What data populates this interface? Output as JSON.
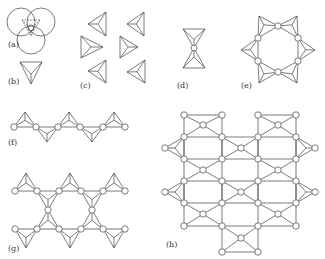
{
  "figure": {
    "panels": [
      {
        "id": "a",
        "label": "(a)",
        "label_pos": [
          8,
          46
        ]
      },
      {
        "id": "b",
        "label": "(b)",
        "label_pos": [
          8,
          82
        ]
      },
      {
        "id": "c",
        "label": "(c)",
        "label_pos": [
          81,
          86
        ]
      },
      {
        "id": "d",
        "label": "(d)",
        "label_pos": [
          177,
          86
        ]
      },
      {
        "id": "e",
        "label": "(e)",
        "label_pos": [
          241,
          86
        ]
      },
      {
        "id": "f",
        "label": "(f)",
        "label_pos": [
          8,
          143
        ]
      },
      {
        "id": "g",
        "label": "(g)",
        "label_pos": [
          8,
          249
        ]
      },
      {
        "id": "h",
        "label": "(h)",
        "label_pos": [
          166,
          245
        ]
      }
    ]
  },
  "colors": {
    "stroke": "#444444",
    "node_fill": "#ffffff",
    "label": "#333333"
  },
  "geometry": {
    "a": {
      "big_circles": [
        [
          21,
          22,
          14
        ],
        [
          41,
          22,
          14
        ],
        [
          31,
          39,
          14
        ]
      ],
      "center_circle": [
        31,
        28,
        3
      ],
      "dashed_lines": [
        [
          31,
          17,
          31,
          25
        ],
        [
          22,
          33,
          28,
          30
        ],
        [
          40,
          33,
          34,
          30
        ],
        [
          24,
          19,
          29,
          26
        ],
        [
          38,
          19,
          33,
          26
        ],
        [
          31,
          31,
          31,
          36
        ]
      ]
    },
    "tetrahedra_c": [
      {
        "tip": [
          88,
          24
        ],
        "base": [
          [
            106,
            12
          ],
          [
            106,
            36
          ]
        ],
        "dir": "left"
      },
      {
        "tip": [
          103,
          47
        ],
        "base": [
          [
            81,
            36
          ],
          [
            81,
            58
          ]
        ],
        "dir": "right"
      },
      {
        "tip": [
          88,
          71
        ],
        "base": [
          [
            106,
            60
          ],
          [
            106,
            83
          ]
        ],
        "dir": "left"
      },
      {
        "tip": [
          127,
          24
        ],
        "base": [
          [
            144,
            12
          ],
          [
            144,
            36
          ]
        ],
        "dir": "left"
      },
      {
        "tip": [
          138,
          47
        ],
        "base": [
          [
            120,
            36
          ],
          [
            120,
            58
          ]
        ],
        "dir": "right"
      },
      {
        "tip": [
          127,
          72
        ],
        "base": [
          [
            145,
            60
          ],
          [
            145,
            83
          ]
        ],
        "dir": "left"
      }
    ],
    "tetrahedron_b": {
      "tip": [
        31,
        84
      ],
      "base": [
        [
          20,
          62
        ],
        [
          42,
          62
        ]
      ]
    },
    "d": {
      "top": {
        "tip": [
          194,
          48
        ],
        "base": [
          [
            183,
            29
          ],
          [
            205,
            29
          ]
        ]
      },
      "bottom": {
        "tip": [
          194,
          48
        ],
        "base": [
          [
            183,
            68
          ],
          [
            205,
            68
          ]
        ]
      },
      "node": [
        194,
        48
      ]
    },
    "e": {
      "nodes": [
        [
          278,
          26
        ],
        [
          258,
          38
        ],
        [
          298,
          38
        ],
        [
          258,
          61
        ],
        [
          298,
          61
        ],
        [
          278,
          72
        ]
      ],
      "tets": [
        {
          "apex": [
            259,
            16
          ],
          "a": [
            258,
            38
          ],
          "b": [
            278,
            26
          ]
        },
        {
          "apex": [
            297,
            16
          ],
          "a": [
            278,
            26
          ],
          "b": [
            298,
            38
          ]
        },
        {
          "apex": [
            241,
            50
          ],
          "a": [
            258,
            38
          ],
          "b": [
            258,
            61
          ]
        },
        {
          "apex": [
            315,
            50
          ],
          "a": [
            298,
            38
          ],
          "b": [
            298,
            61
          ]
        },
        {
          "apex": [
            259,
            83
          ],
          "a": [
            258,
            61
          ],
          "b": [
            278,
            72
          ]
        },
        {
          "apex": [
            297,
            83
          ],
          "a": [
            278,
            72
          ],
          "b": [
            298,
            61
          ]
        }
      ]
    },
    "f": {
      "nodes": [
        [
          14,
          127
        ],
        [
          36,
          127
        ],
        [
          58,
          127
        ],
        [
          80,
          127
        ],
        [
          103,
          127
        ],
        [
          125,
          127
        ]
      ],
      "tets": [
        {
          "apex": [
            25,
            112
          ],
          "a": [
            14,
            127
          ],
          "b": [
            36,
            127
          ]
        },
        {
          "apex": [
            47,
            142
          ],
          "a": [
            36,
            127
          ],
          "b": [
            58,
            127
          ]
        },
        {
          "apex": [
            69,
            112
          ],
          "a": [
            58,
            127
          ],
          "b": [
            80,
            127
          ]
        },
        {
          "apex": [
            92,
            142
          ],
          "a": [
            80,
            127
          ],
          "b": [
            103,
            127
          ]
        },
        {
          "apex": [
            114,
            112
          ],
          "a": [
            103,
            127
          ],
          "b": [
            125,
            127
          ]
        }
      ]
    },
    "g": {
      "nodes": [
        [
          15,
          191
        ],
        [
          37,
          191
        ],
        [
          59,
          191
        ],
        [
          81,
          191
        ],
        [
          103,
          191
        ],
        [
          125,
          191
        ],
        [
          48,
          210
        ],
        [
          92,
          210
        ],
        [
          15,
          229
        ],
        [
          37,
          229
        ],
        [
          59,
          229
        ],
        [
          81,
          229
        ],
        [
          103,
          229
        ],
        [
          125,
          229
        ]
      ],
      "tets": [
        {
          "apex": [
            26,
            173
          ],
          "a": [
            15,
            191
          ],
          "b": [
            37,
            191
          ]
        },
        {
          "apex": [
            70,
            173
          ],
          "a": [
            59,
            191
          ],
          "b": [
            81,
            191
          ]
        },
        {
          "apex": [
            114,
            173
          ],
          "a": [
            103,
            191
          ],
          "b": [
            125,
            191
          ]
        },
        {
          "apex": [
            48,
            210
          ],
          "a": [
            37,
            191
          ],
          "b": [
            59,
            191
          ]
        },
        {
          "apex": [
            92,
            210
          ],
          "a": [
            81,
            191
          ],
          "b": [
            103,
            191
          ]
        },
        {
          "apex": [
            48,
            210
          ],
          "a": [
            37,
            229
          ],
          "b": [
            59,
            229
          ]
        },
        {
          "apex": [
            92,
            210
          ],
          "a": [
            81,
            229
          ],
          "b": [
            103,
            229
          ]
        },
        {
          "apex": [
            26,
            248
          ],
          "a": [
            15,
            229
          ],
          "b": [
            37,
            229
          ]
        },
        {
          "apex": [
            70,
            248
          ],
          "a": [
            59,
            229
          ],
          "b": [
            81,
            229
          ]
        },
        {
          "apex": [
            114,
            248
          ],
          "a": [
            103,
            229
          ],
          "b": [
            125,
            229
          ]
        }
      ]
    },
    "h": {
      "nodes": [
        [
          184,
          115
        ],
        [
          222,
          115
        ],
        [
          297,
          115
        ],
        [
          335,
          115
        ],
        [
          203,
          125
        ],
        [
          316,
          125
        ],
        [
          184,
          137
        ],
        [
          222,
          137
        ],
        [
          297,
          137
        ],
        [
          315,
          137
        ],
        [
          165,
          148
        ],
        [
          241,
          148
        ],
        [
          278,
          148
        ],
        [
          315,
          148
        ],
        [
          184,
          159
        ],
        [
          222,
          159
        ],
        [
          297,
          159
        ],
        [
          315,
          159
        ],
        [
          203,
          170
        ],
        [
          278,
          170
        ],
        [
          184,
          181
        ],
        [
          222,
          181
        ],
        [
          297,
          181
        ],
        [
          315,
          181
        ],
        [
          165,
          192
        ],
        [
          241,
          192
        ],
        [
          315,
          192
        ],
        [
          184,
          203
        ],
        [
          222,
          203
        ],
        [
          297,
          203
        ],
        [
          315,
          203
        ],
        [
          203,
          214
        ],
        [
          278,
          214
        ],
        [
          184,
          226
        ],
        [
          222,
          226
        ],
        [
          297,
          226
        ],
        [
          315,
          226
        ],
        [
          241,
          236
        ],
        [
          222,
          252
        ],
        [
          297,
          252
        ]
      ],
      "tets": [
        [
          [
            184,
            115
          ],
          [
            222,
            115
          ],
          [
            184,
            137
          ],
          [
            222,
            137
          ],
          [
            203,
            125
          ]
        ],
        [
          [
            297,
            115
          ],
          [
            315,
            115
          ],
          [
            297,
            137
          ],
          [
            315,
            137
          ],
          [
            316,
            125
          ]
        ]
      ]
    }
  }
}
